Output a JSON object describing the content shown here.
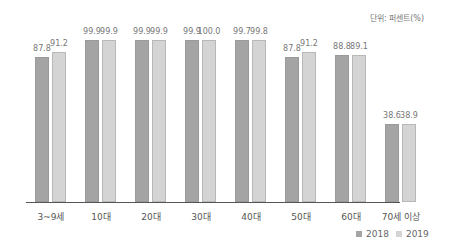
{
  "unit_label": "단위: 퍼센트(%)",
  "colors": {
    "2018": "#a4a4a4",
    "2019": "#d4d4d4"
  },
  "legend": [
    {
      "label": "2018",
      "color": "#a4a4a4"
    },
    {
      "label": "2019",
      "color": "#d4d4d4"
    }
  ],
  "chart_data": {
    "type": "bar",
    "title": "",
    "xlabel": "",
    "ylabel": "",
    "unit": "단위: 퍼센트(%)",
    "categories": [
      "3~9세",
      "10대",
      "20대",
      "30대",
      "40대",
      "50대",
      "60대",
      "70세 이상"
    ],
    "series": [
      {
        "name": "2018",
        "values": [
          87.8,
          99.9,
          99.9,
          99.9,
          99.7,
          87.8,
          88.8,
          38.6
        ]
      },
      {
        "name": "2019",
        "values": [
          91.2,
          99.9,
          99.9,
          100.0,
          99.8,
          91.2,
          89.1,
          38.9
        ]
      }
    ],
    "value_labels": [
      [
        "87.8",
        "91.2"
      ],
      [
        "99.9",
        "99.9"
      ],
      [
        "99.9",
        "99.9"
      ],
      [
        "99.9",
        "100.0"
      ],
      [
        "99.7",
        "99.8"
      ],
      [
        "87.8",
        "91.2"
      ],
      [
        "88.8",
        "89.1"
      ],
      [
        "38.6",
        "38.9"
      ]
    ],
    "grid": false,
    "legend_position": "bottom-right",
    "ylim": [
      0,
      100
    ]
  }
}
